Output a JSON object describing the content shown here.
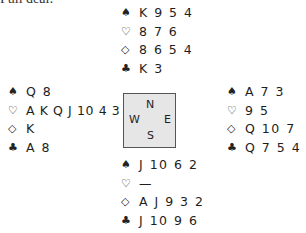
{
  "caption": "Full deal:",
  "suits": {
    "spades": "♠",
    "hearts": "♡",
    "diamonds": "◇",
    "clubs": "♣"
  },
  "north": {
    "spades": "K 9 5 4",
    "hearts": "8 7 6",
    "diamonds": "8 6 5 4",
    "clubs": "K 3"
  },
  "west": {
    "spades": "Q 8",
    "hearts": "A K Q J 10 4 3 2",
    "diamonds": "K",
    "clubs": "A 8"
  },
  "east": {
    "spades": "A 7 3",
    "hearts": "9 5",
    "diamonds": "Q 10 7",
    "clubs": "Q 7 5 4 2"
  },
  "south": {
    "spades": "J 10 6 2",
    "hearts": "—",
    "diamonds": "A J 9 3 2",
    "clubs": "J 10 9 6"
  },
  "compass": {
    "n": "N",
    "w": "W",
    "e": "E",
    "s": "S"
  }
}
